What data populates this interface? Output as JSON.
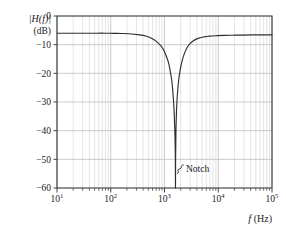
{
  "chart_data": {
    "type": "line",
    "title": "",
    "xlabel": "f (Hz)",
    "ylabel": "|H(f)| (dB)",
    "ylabel_line1": "|H(f)|",
    "ylabel_line2": "(dB)",
    "xscale": "log",
    "xlim": [
      10,
      100000
    ],
    "ylim": [
      -60,
      0
    ],
    "grid": true,
    "x_tick_labels": [
      "10",
      "10",
      "10",
      "10",
      "10"
    ],
    "x_tick_exponents": [
      "1",
      "2",
      "3",
      "4",
      "5"
    ],
    "x_tick_values": [
      10,
      100,
      1000,
      10000,
      100000
    ],
    "y_tick_labels": [
      "0",
      "−10",
      "−20",
      "−30",
      "−40",
      "−50",
      "−60"
    ],
    "y_tick_values": [
      0,
      -10,
      -20,
      -30,
      -40,
      -50,
      -60
    ],
    "passband_gain_db": -6,
    "notch_frequency_hz": 1600,
    "notch_depth_db": -60,
    "annotations": [
      {
        "label": "Notch",
        "x_hz": 1600,
        "y_db": -53
      }
    ],
    "series": [
      {
        "name": "|H(f)|",
        "x": [
          10,
          14,
          20,
          28,
          40,
          56,
          80,
          110,
          160,
          220,
          320,
          450,
          630,
          800,
          950,
          1100,
          1200,
          1300,
          1380,
          1450,
          1500,
          1540,
          1570,
          1590,
          1600,
          1610,
          1630,
          1660,
          1700,
          1760,
          1850,
          1980,
          2150,
          2400,
          2800,
          3400,
          4200,
          5400,
          7000,
          9500,
          13000,
          19000,
          28000,
          42000,
          65000,
          100000
        ],
        "y": [
          -6.0,
          -6.0,
          -6.0,
          -6.0,
          -6.0,
          -6.0,
          -6.0,
          -6.05,
          -6.1,
          -6.2,
          -6.5,
          -7.0,
          -8.2,
          -9.8,
          -11.6,
          -14.4,
          -16.6,
          -20.0,
          -23.2,
          -28.0,
          -32.0,
          -37.5,
          -42.5,
          -49.0,
          -60.0,
          -49.5,
          -41.0,
          -35.0,
          -30.2,
          -26.0,
          -21.8,
          -18.3,
          -15.3,
          -12.6,
          -10.2,
          -8.7,
          -7.8,
          -7.3,
          -7.0,
          -6.85,
          -6.75,
          -6.7,
          -6.65,
          -6.6,
          -6.6,
          -6.6
        ]
      }
    ],
    "colors": {
      "curve": "#2e2e2e",
      "grid": "#b9b9b9",
      "minor_grid": "#d2d2d2",
      "frame": "#3a3a3a",
      "text": "#1a1a1a",
      "background": "#ffffff"
    }
  },
  "figure": {
    "y_axis_label_top": "|H(f)|",
    "y_axis_label_bottom": "(dB)",
    "x_axis_label_base": "f",
    "x_axis_label_unit": "(Hz)",
    "notch_label": "Notch"
  }
}
